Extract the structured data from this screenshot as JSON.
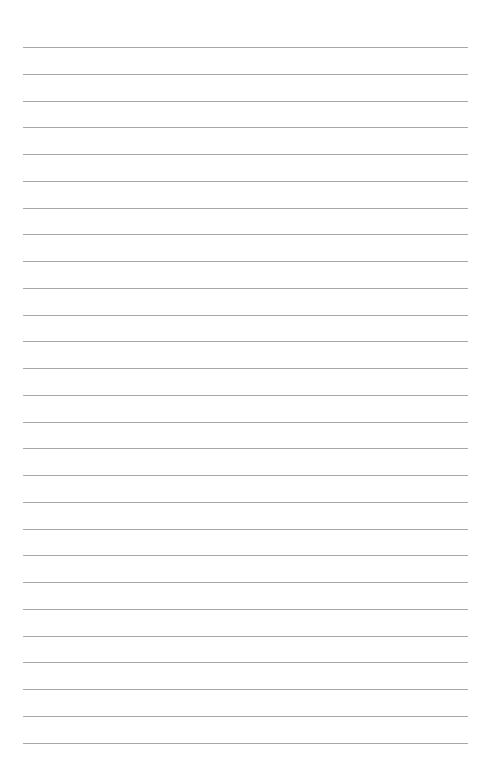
{
  "page": {
    "type": "lined-paper",
    "background_color": "#ffffff",
    "line_color": "#a8a8a8",
    "line_count": 27,
    "first_line_y": 47,
    "line_spacing": 26.75,
    "line_left": 23,
    "line_right": 468
  }
}
